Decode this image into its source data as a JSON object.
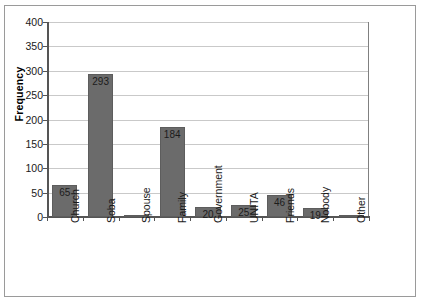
{
  "chart_data": {
    "type": "bar",
    "title": "",
    "subtitle": "",
    "xlabel": "",
    "ylabel": "Frequency",
    "categories": [
      "Church",
      "Soba",
      "Spouse",
      "Family",
      "Government",
      "UNITA",
      "Friends",
      "Nobody",
      "Other"
    ],
    "values": [
      65,
      293,
      3,
      184,
      20,
      25,
      46,
      19,
      2
    ],
    "data_labels": [
      "65",
      "293",
      "",
      "184",
      "20",
      "25",
      "46",
      "19",
      ""
    ],
    "ylim": [
      0,
      400
    ],
    "ytick_labels": [
      "400",
      "350",
      "300",
      "250",
      "200",
      "150",
      "100",
      "50",
      "0"
    ],
    "ytick_values": [
      400,
      350,
      300,
      250,
      200,
      150,
      100,
      50,
      0
    ],
    "grid": "horizontal",
    "legend": "none",
    "bar_color": "#6b6b6b",
    "gridline_color": "#c9c9c9",
    "axis_color": "#555555",
    "frame_color": "#9a9a9a",
    "background_color": "#ffffff"
  }
}
